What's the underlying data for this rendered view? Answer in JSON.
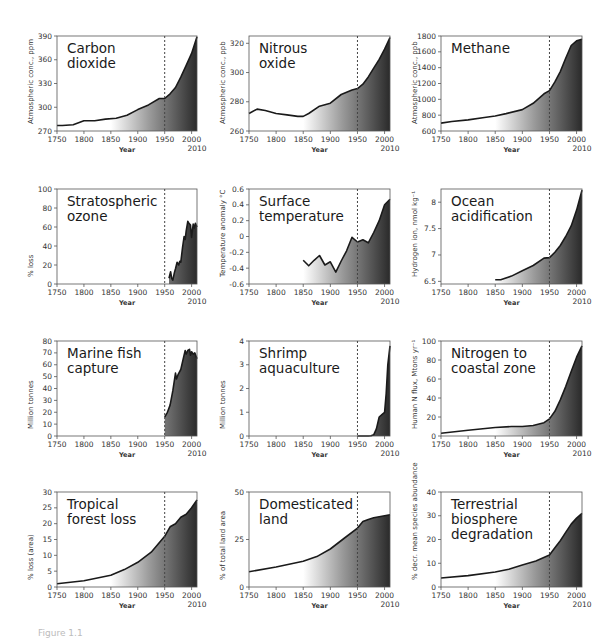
{
  "figure": {
    "caption": "Figure 1.1"
  },
  "chart_data": [
    {
      "id": "co2",
      "type": "area",
      "title": "Carbon\ndioxide",
      "xlabel": "Year",
      "ylabel": "Atmospheric conc., ppm",
      "xlim": [
        1750,
        2010
      ],
      "ylim": [
        270,
        390
      ],
      "yticks": [
        270,
        300,
        330,
        360,
        390
      ],
      "xticks": [
        1750,
        1800,
        1850,
        1900,
        1950,
        2000
      ],
      "xextra": "2010",
      "marker_year": 1950,
      "x": [
        1750,
        1760,
        1780,
        1800,
        1820,
        1840,
        1860,
        1880,
        1900,
        1920,
        1940,
        1950,
        1960,
        1970,
        1980,
        1990,
        2000,
        2010
      ],
      "values": [
        277,
        277,
        278,
        283,
        283,
        285,
        286,
        290,
        297,
        303,
        311,
        311,
        317,
        325,
        338,
        353,
        368,
        389
      ]
    },
    {
      "id": "n2o",
      "type": "area",
      "title": "Nitrous\noxide",
      "xlabel": "Year",
      "ylabel": "Atmospheric conc., ppb",
      "xlim": [
        1750,
        2010
      ],
      "ylim": [
        260,
        325
      ],
      "yticks": [
        260,
        280,
        300,
        320
      ],
      "xticks": [
        1750,
        1800,
        1850,
        1900,
        1950,
        2000
      ],
      "xextra": "2010",
      "marker_year": 1950,
      "x": [
        1750,
        1765,
        1780,
        1800,
        1820,
        1840,
        1850,
        1860,
        1880,
        1900,
        1920,
        1940,
        1950,
        1960,
        1970,
        1980,
        1990,
        2000,
        2010
      ],
      "values": [
        272,
        275,
        274,
        272,
        271,
        270,
        270,
        272,
        277,
        279,
        285,
        288,
        289,
        292,
        297,
        303,
        309,
        316,
        324
      ]
    },
    {
      "id": "ch4",
      "type": "area",
      "title": "Methane",
      "xlabel": "Year",
      "ylabel": "Atmospheric conc., ppb",
      "xlim": [
        1750,
        2010
      ],
      "ylim": [
        600,
        1800
      ],
      "yticks": [
        600,
        800,
        1000,
        1200,
        1400,
        1600,
        1800
      ],
      "xticks": [
        1750,
        1800,
        1850,
        1900,
        1950,
        2000
      ],
      "xextra": "2010",
      "marker_year": 1950,
      "x": [
        1750,
        1770,
        1800,
        1830,
        1850,
        1870,
        1900,
        1920,
        1940,
        1950,
        1960,
        1970,
        1980,
        1990,
        2000,
        2010
      ],
      "values": [
        700,
        720,
        740,
        770,
        790,
        820,
        870,
        950,
        1070,
        1110,
        1220,
        1350,
        1520,
        1680,
        1740,
        1760
      ]
    },
    {
      "id": "ozone",
      "type": "area",
      "title": "Stratospheric\nozone",
      "xlabel": "Year",
      "ylabel": "% loss",
      "xlim": [
        1750,
        2010
      ],
      "ylim": [
        0,
        100
      ],
      "yticks": [
        0,
        20,
        40,
        60,
        80,
        100
      ],
      "xticks": [
        1750,
        1800,
        1850,
        1900,
        1950,
        2000
      ],
      "xextra": "2010",
      "marker_year": 1950,
      "x": [
        1958,
        1961,
        1963,
        1965,
        1968,
        1970,
        1973,
        1976,
        1978,
        1980,
        1983,
        1986,
        1988,
        1990,
        1993,
        1995,
        1998,
        2000,
        2003,
        2005,
        2007,
        2010
      ],
      "values": [
        6,
        13,
        6,
        4,
        12,
        16,
        23,
        20,
        24,
        23,
        38,
        50,
        47,
        56,
        66,
        64,
        62,
        49,
        63,
        59,
        64,
        60
      ]
    },
    {
      "id": "temp",
      "type": "area",
      "title": "Surface\ntemperature",
      "xlabel": "Year",
      "ylabel": "Temperature anomaly °C",
      "xlim": [
        1750,
        2010
      ],
      "ylim": [
        -0.6,
        0.6
      ],
      "yticks": [
        -0.6,
        -0.4,
        -0.2,
        0,
        0.2,
        0.4,
        0.6
      ],
      "xticks": [
        1750,
        1800,
        1850,
        1900,
        1950,
        2000
      ],
      "xextra": "2010",
      "marker_year": 1950,
      "x": [
        1850,
        1860,
        1870,
        1880,
        1890,
        1900,
        1910,
        1920,
        1930,
        1940,
        1950,
        1960,
        1970,
        1980,
        1990,
        2000,
        2010
      ],
      "values": [
        -0.3,
        -0.37,
        -0.3,
        -0.24,
        -0.36,
        -0.32,
        -0.45,
        -0.31,
        -0.18,
        -0.01,
        -0.07,
        -0.04,
        -0.08,
        0.05,
        0.2,
        0.4,
        0.47
      ]
    },
    {
      "id": "ocean",
      "type": "area",
      "title": "Ocean\nacidification",
      "xlabel": "Year",
      "ylabel": "Hydrogen ion, nmol kg⁻¹",
      "xlim": [
        1750,
        2010
      ],
      "ylim": [
        6.45,
        8.25
      ],
      "yticks": [
        6.5,
        7.0,
        7.5,
        8.0
      ],
      "xticks": [
        1750,
        1800,
        1850,
        1900,
        1950,
        2000
      ],
      "xextra": "2010",
      "marker_year": 1950,
      "x": [
        1850,
        1860,
        1880,
        1900,
        1920,
        1940,
        1950,
        1960,
        1970,
        1980,
        1990,
        2000,
        2010
      ],
      "values": [
        6.53,
        6.53,
        6.6,
        6.7,
        6.8,
        6.94,
        6.95,
        7.05,
        7.18,
        7.35,
        7.55,
        7.85,
        8.23
      ]
    },
    {
      "id": "fish",
      "type": "area",
      "title": "Marine fish\ncapture",
      "xlabel": "Year",
      "ylabel": "Million tonnes",
      "xlim": [
        1750,
        2010
      ],
      "ylim": [
        0,
        80
      ],
      "yticks": [
        0,
        10,
        20,
        30,
        40,
        50,
        60,
        70,
        80
      ],
      "xticks": [
        1750,
        1800,
        1850,
        1900,
        1950,
        2000
      ],
      "xextra": "2010",
      "marker_year": 1950,
      "x": [
        1950,
        1955,
        1960,
        1965,
        1970,
        1972,
        1975,
        1980,
        1985,
        1988,
        1990,
        1993,
        1996,
        1998,
        2000,
        2003,
        2006,
        2010
      ],
      "values": [
        16,
        20,
        26,
        38,
        53,
        48,
        52,
        56,
        66,
        72,
        69,
        72,
        73,
        68,
        71,
        69,
        70,
        65
      ]
    },
    {
      "id": "shrimp",
      "type": "area",
      "title": "Shrimp\naquaculture",
      "xlabel": "Year",
      "ylabel": "Million tonnes",
      "xlim": [
        1750,
        2010
      ],
      "ylim": [
        0,
        4
      ],
      "yticks": [
        0,
        1,
        2,
        3,
        4
      ],
      "xticks": [
        1750,
        1800,
        1850,
        1900,
        1950,
        2000
      ],
      "xextra": "2010",
      "marker_year": 1950,
      "x": [
        1950,
        1970,
        1975,
        1980,
        1985,
        1990,
        1995,
        2000,
        2003,
        2006,
        2010
      ],
      "values": [
        0,
        0,
        0.01,
        0.05,
        0.3,
        0.8,
        0.9,
        1.0,
        1.8,
        3.0,
        3.8
      ]
    },
    {
      "id": "nitrogen",
      "type": "area",
      "title": "Nitrogen to\ncoastal zone",
      "xlabel": "Year",
      "ylabel": "Human N flux, Mtons yr⁻¹",
      "xlim": [
        1750,
        2010
      ],
      "ylim": [
        0,
        100
      ],
      "yticks": [
        0,
        20,
        40,
        60,
        80,
        100
      ],
      "xticks": [
        1750,
        1800,
        1850,
        1900,
        1950,
        2000
      ],
      "xextra": "2010",
      "marker_year": 1950,
      "x": [
        1750,
        1800,
        1850,
        1880,
        1900,
        1920,
        1940,
        1950,
        1960,
        1970,
        1980,
        1990,
        2000,
        2010
      ],
      "values": [
        3,
        6,
        9,
        10,
        10,
        11,
        14,
        18,
        26,
        38,
        52,
        68,
        83,
        95
      ]
    },
    {
      "id": "forest",
      "type": "area",
      "title": "Tropical\nforest loss",
      "xlabel": "Year",
      "ylabel": "% loss (area)",
      "xlim": [
        1750,
        2010
      ],
      "ylim": [
        0,
        30
      ],
      "yticks": [
        0,
        5,
        10,
        15,
        20,
        25,
        30
      ],
      "xticks": [
        1750,
        1800,
        1850,
        1900,
        1950,
        2000
      ],
      "xextra": "2010",
      "marker_year": 1950,
      "x": [
        1750,
        1800,
        1850,
        1875,
        1900,
        1925,
        1950,
        1960,
        1970,
        1980,
        1990,
        2000,
        2010
      ],
      "values": [
        1,
        2,
        3.7,
        5.5,
        7.8,
        11,
        16,
        19,
        20,
        22,
        23,
        25,
        27.5
      ]
    },
    {
      "id": "land",
      "type": "area",
      "title": "Domesticated\nland",
      "xlabel": "Year",
      "ylabel": "% of total land area",
      "xlim": [
        1750,
        2010
      ],
      "ylim": [
        0,
        50
      ],
      "yticks": [
        0,
        25,
        50
      ],
      "xticks": [
        1750,
        1800,
        1850,
        1900,
        1950,
        2000
      ],
      "xextra": "2010",
      "marker_year": 1950,
      "x": [
        1750,
        1800,
        1850,
        1875,
        1900,
        1925,
        1950,
        1960,
        1970,
        1980,
        1990,
        2000,
        2010
      ],
      "values": [
        8,
        10.5,
        13.5,
        16,
        20,
        25.5,
        31,
        34.5,
        35.5,
        36.5,
        37,
        37.5,
        38
      ]
    },
    {
      "id": "biosphere",
      "type": "area",
      "title": "Terrestrial\nbiosphere\ndegradation",
      "xlabel": "Year",
      "ylabel": "% decr. mean species abundance",
      "xlim": [
        1750,
        2010
      ],
      "ylim": [
        0,
        40
      ],
      "yticks": [
        0,
        10,
        20,
        30,
        40
      ],
      "xticks": [
        1750,
        1800,
        1850,
        1900,
        1950,
        2000
      ],
      "xextra": "2010",
      "marker_year": 1950,
      "x": [
        1750,
        1800,
        1850,
        1875,
        1900,
        1925,
        1950,
        1960,
        1970,
        1980,
        1990,
        2000,
        2010
      ],
      "values": [
        3.8,
        4.8,
        6.3,
        7.5,
        9.3,
        11,
        13.5,
        16.5,
        19.5,
        23,
        26.5,
        29,
        31
      ]
    }
  ]
}
